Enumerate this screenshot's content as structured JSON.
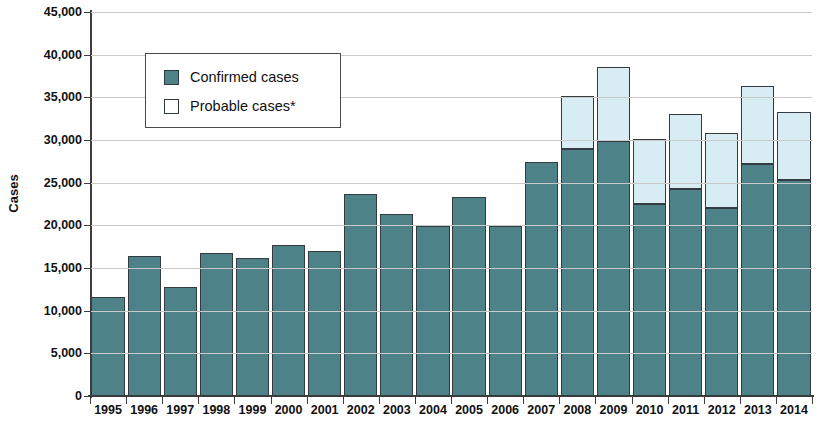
{
  "chart_data": {
    "type": "bar",
    "stacked": true,
    "title": "",
    "xlabel": "",
    "ylabel": "Cases",
    "ylim": [
      0,
      45000
    ],
    "ytick_step": 5000,
    "ytick_labels": [
      "45,000",
      "40,000",
      "35,000",
      "30,000",
      "25,000",
      "20,000",
      "15,000",
      "10,000",
      "5,000",
      "0"
    ],
    "ytick_values": [
      45000,
      40000,
      35000,
      30000,
      25000,
      20000,
      15000,
      10000,
      5000,
      0
    ],
    "grid": true,
    "legend_position": "upper-left-inside",
    "categories": [
      "1995",
      "1996",
      "1997",
      "1998",
      "1999",
      "2000",
      "2001",
      "2002",
      "2003",
      "2004",
      "2005",
      "2006",
      "2007",
      "2008",
      "2009",
      "2010",
      "2011",
      "2012",
      "2013",
      "2014"
    ],
    "series": [
      {
        "name": "Confirmed cases",
        "color": "#4d8289",
        "values": [
          11600,
          16400,
          12800,
          16800,
          16200,
          17700,
          17000,
          23700,
          21300,
          19900,
          23300,
          19900,
          27400,
          28900,
          29900,
          22500,
          24300,
          22000,
          27200,
          25300
        ]
      },
      {
        "name": "Probable cases*",
        "color": "#d8edf3",
        "values": [
          0,
          0,
          0,
          0,
          0,
          0,
          0,
          0,
          0,
          0,
          0,
          0,
          0,
          6300,
          8600,
          7600,
          8700,
          8800,
          9100,
          8000
        ]
      }
    ],
    "totals": [
      11600,
      16400,
      12800,
      16800,
      16200,
      17700,
      17000,
      23700,
      21300,
      19900,
      23300,
      19900,
      27400,
      35200,
      38500,
      30100,
      33000,
      30800,
      36300,
      33300
    ]
  },
  "legend": {
    "items": [
      {
        "label": "Confirmed cases",
        "swatch": "#4d8289"
      },
      {
        "label": "Probable cases*",
        "swatch": "#ffffff"
      }
    ]
  },
  "axis": {
    "y_title": "Cases"
  }
}
